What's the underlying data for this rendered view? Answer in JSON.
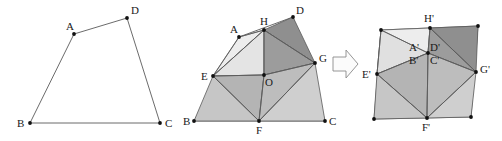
{
  "figure": {
    "background_color": "#ffffff",
    "stroke_color": "#4d4d4d",
    "dot_color": "#111111",
    "label_color": "#1a1a1a",
    "panels": [
      {
        "name": "original-quadrilateral",
        "labels": [
          "A",
          "B",
          "C",
          "D"
        ],
        "vertices": {
          "A": [
            74,
            34
          ],
          "B": [
            30,
            123
          ],
          "C": [
            160,
            123
          ],
          "D": [
            127,
            18
          ]
        }
      },
      {
        "name": "dissected-quadrilateral",
        "labels": [
          "A",
          "B",
          "C",
          "D",
          "E",
          "F",
          "G",
          "H",
          "O"
        ],
        "vertices": {
          "A": [
            239,
            37
          ],
          "B": [
            194,
            121
          ],
          "C": [
            325,
            121
          ],
          "D": [
            293,
            17
          ],
          "E": [
            213,
            76
          ],
          "F": [
            259,
            121
          ],
          "G": [
            315,
            63
          ],
          "H": [
            264,
            30
          ],
          "O": [
            264,
            75
          ]
        }
      },
      {
        "name": "rearranged-square",
        "labels": [
          "A'",
          "B'",
          "C'",
          "D'",
          "E'",
          "F'",
          "G'",
          "H'"
        ],
        "vertices": {
          "A'": [
            428,
            53
          ],
          "B'": [
            428,
            53
          ],
          "C'": [
            428,
            53
          ],
          "D'": [
            428,
            53
          ],
          "E'": [
            377,
            74
          ],
          "F'": [
            427,
            118
          ],
          "G'": [
            476,
            72
          ],
          "H'": [
            430,
            28
          ],
          "corner_tl": [
            381,
            30
          ],
          "corner_tr": [
            478,
            26
          ],
          "corner_bl": [
            374,
            119
          ],
          "corner_br": [
            471,
            117
          ]
        }
      }
    ],
    "arrow": {
      "name": "transformation-arrow",
      "direction": "right",
      "x": 333,
      "y": 50,
      "width": 26,
      "height": 28
    },
    "fill_colors": {
      "very_light": "#eeeeee",
      "light": "#dcdcdc",
      "medium_light": "#cacaca",
      "medium": "#b6b6b6",
      "dark": "#9a9a9a",
      "darker": "#8c8c8c",
      "arrow_fill": "#fafafa"
    }
  }
}
